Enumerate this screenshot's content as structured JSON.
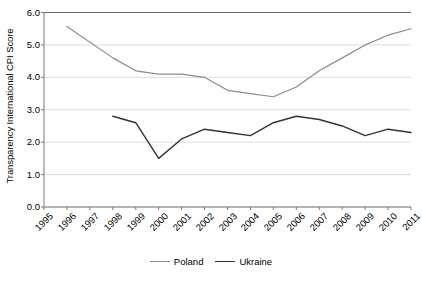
{
  "chart_data": {
    "type": "line",
    "title": "",
    "xlabel": "",
    "ylabel": "Transparency International CPI Score",
    "x": [
      1995,
      1996,
      1997,
      1998,
      1999,
      2000,
      2001,
      2002,
      2003,
      2004,
      2005,
      2006,
      2007,
      2008,
      2009,
      2010,
      2011
    ],
    "xtick_labels": [
      "1995",
      "1996",
      "1997",
      "1998",
      "1999",
      "2000",
      "2001",
      "2002",
      "2003",
      "2004",
      "2005",
      "2006",
      "2007",
      "2008",
      "2009",
      "2010",
      "2011"
    ],
    "ytick_labels": [
      "0.0",
      "1.0",
      "2.0",
      "3.0",
      "4.0",
      "5.0",
      "6.0"
    ],
    "ytick_values": [
      0.0,
      1.0,
      2.0,
      3.0,
      4.0,
      5.0,
      6.0
    ],
    "ylim": [
      0.0,
      6.0
    ],
    "xlim": [
      1995,
      2011
    ],
    "grid": "horizontal",
    "legend_position": "bottom-center",
    "series": [
      {
        "name": "Poland",
        "color": "#8c8c8c",
        "values": [
          null,
          5.57,
          null,
          4.6,
          4.2,
          4.1,
          4.1,
          4.0,
          3.6,
          3.5,
          3.4,
          3.7,
          4.2,
          4.6,
          5.0,
          5.3,
          5.5
        ]
      },
      {
        "name": "Ukraine",
        "color": "#333333",
        "values": [
          null,
          null,
          null,
          2.8,
          2.6,
          1.5,
          2.1,
          2.4,
          2.3,
          2.2,
          2.6,
          2.8,
          2.7,
          2.5,
          2.2,
          2.4,
          2.3
        ]
      }
    ]
  },
  "legend": {
    "items": [
      {
        "label": "Poland",
        "color": "#8c8c8c"
      },
      {
        "label": "Ukraine",
        "color": "#333333"
      }
    ]
  },
  "axes": {
    "y_title": "Transparency International CPI Score"
  }
}
